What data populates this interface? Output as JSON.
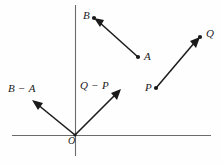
{
  "figure": {
    "background_color": "#fefefe",
    "axis_color": "#6b6b6b",
    "vector_color": "#1a1a1a",
    "origin_label": "O",
    "axes": {
      "x_axis": {
        "name": "horizontal-axis",
        "x1": 12,
        "y1": 135,
        "x2": 211,
        "y2": 136
      },
      "y_axis": {
        "name": "vertical-axis",
        "x1": 75,
        "y1": 5,
        "x2": 75,
        "y2": 156
      },
      "origin": {
        "x": 75,
        "y": 135
      }
    },
    "points": [
      {
        "id": "B",
        "label": "B",
        "x": 94,
        "y": 18,
        "label_x": 83,
        "label_y": 10
      },
      {
        "id": "A",
        "label": "A",
        "x": 138,
        "y": 57,
        "label_x": 144,
        "label_y": 51
      },
      {
        "id": "Q",
        "label": "Q",
        "x": 200,
        "y": 37,
        "label_x": 206,
        "label_y": 28
      },
      {
        "id": "P",
        "label": "P",
        "x": 156,
        "y": 88,
        "label_x": 145,
        "label_y": 82
      }
    ],
    "vectors": [
      {
        "id": "AB",
        "name": "vector-a-to-b",
        "label": "",
        "from": {
          "x": 138,
          "y": 57
        },
        "to": {
          "x": 94,
          "y": 18
        },
        "arrowhead_at": "to"
      },
      {
        "id": "PQ",
        "name": "vector-p-to-q",
        "label": "",
        "from": {
          "x": 156,
          "y": 88
        },
        "to": {
          "x": 200,
          "y": 37
        },
        "arrowhead_at": "to"
      },
      {
        "id": "B-A",
        "name": "vector-b-minus-a",
        "label": "B − A",
        "from": {
          "x": 75,
          "y": 135
        },
        "to": {
          "x": 32,
          "y": 100
        },
        "arrowhead_at": "to",
        "label_x": 8,
        "label_y": 83
      },
      {
        "id": "Q-P",
        "name": "vector-q-minus-p",
        "label": "Q − P",
        "from": {
          "x": 75,
          "y": 135
        },
        "to": {
          "x": 121,
          "y": 89
        },
        "arrowhead_at": "to",
        "label_x": 80,
        "label_y": 80
      }
    ]
  }
}
